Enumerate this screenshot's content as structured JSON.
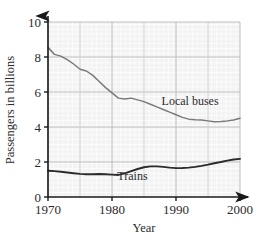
{
  "chart_data": {
    "type": "line",
    "title": "",
    "xlabel": "Year",
    "ylabel": "Passengers in billions",
    "xlim": [
      1970,
      2000
    ],
    "ylim": [
      0,
      10
    ],
    "xticks": [
      1970,
      1980,
      1990,
      2000
    ],
    "xtick_labels": [
      "1970",
      "1980",
      "1990",
      "2000"
    ],
    "yticks": [
      0,
      2,
      4,
      6,
      8,
      10
    ],
    "ytick_labels": [
      "0",
      "2",
      "4",
      "6",
      "8",
      "10"
    ],
    "grid": true,
    "grid_minor": true,
    "legend_position": "inline-annotation",
    "series": [
      {
        "name": "Local buses",
        "color": "#7a7a7a",
        "label_x": 1992.2,
        "label_y": 5.25,
        "x": [
          1970,
          1971,
          1972,
          1973,
          1974,
          1975,
          1976,
          1977,
          1978,
          1979,
          1980,
          1981,
          1982,
          1983,
          1984,
          1985,
          1986,
          1987,
          1988,
          1989,
          1990,
          1991,
          1992,
          1993,
          1994,
          1995,
          1996,
          1997,
          1998,
          1999,
          2000
        ],
        "values": [
          8.55,
          8.15,
          8.05,
          7.85,
          7.6,
          7.3,
          7.2,
          6.95,
          6.6,
          6.25,
          5.95,
          5.65,
          5.6,
          5.65,
          5.55,
          5.45,
          5.3,
          5.15,
          5.0,
          4.85,
          4.7,
          4.55,
          4.45,
          4.42,
          4.4,
          4.35,
          4.3,
          4.32,
          4.35,
          4.4,
          4.5
        ]
      },
      {
        "name": "Trains",
        "color": "#2b2b2b",
        "label_x": 1983.2,
        "label_y": 1.0,
        "x": [
          1970,
          1971,
          1972,
          1973,
          1974,
          1975,
          1976,
          1977,
          1978,
          1979,
          1980,
          1981,
          1982,
          1983,
          1984,
          1985,
          1986,
          1987,
          1988,
          1989,
          1990,
          1991,
          1992,
          1993,
          1994,
          1995,
          1996,
          1997,
          1998,
          1999,
          2000
        ],
        "values": [
          1.5,
          1.48,
          1.44,
          1.4,
          1.36,
          1.32,
          1.3,
          1.3,
          1.31,
          1.3,
          1.28,
          1.26,
          1.35,
          1.48,
          1.6,
          1.7,
          1.75,
          1.75,
          1.72,
          1.68,
          1.65,
          1.66,
          1.68,
          1.72,
          1.78,
          1.85,
          1.93,
          2.0,
          2.08,
          2.14,
          2.18
        ]
      }
    ]
  },
  "axes": {
    "x_arrow": "arrow-right",
    "y_arrow": "arrow-up"
  }
}
